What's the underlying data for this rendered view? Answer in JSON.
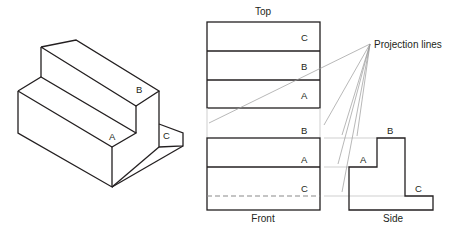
{
  "isometric": {
    "labels": {
      "a": "A",
      "b": "B",
      "c": "C"
    }
  },
  "views": {
    "top": {
      "title": "Top",
      "labels": [
        "C",
        "B",
        "A"
      ]
    },
    "front": {
      "title": "Front",
      "labels": {
        "b": "B",
        "a": "A",
        "c": "C"
      },
      "hidden_line": "C"
    },
    "side": {
      "title": "Side",
      "labels": {
        "b": "B",
        "a": "A",
        "c": "C"
      }
    }
  },
  "annotation": {
    "projection_lines": "Projection lines"
  },
  "colors": {
    "line": "#231f20",
    "projection": "#9a9a9a",
    "hidden": "#8a8a8a",
    "background": "#ffffff"
  }
}
